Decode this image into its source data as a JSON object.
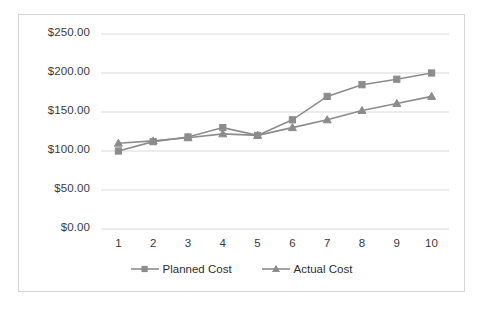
{
  "chart_data": {
    "type": "line",
    "title": "",
    "xlabel": "",
    "ylabel": "",
    "x": [
      1,
      2,
      3,
      4,
      5,
      6,
      7,
      8,
      9,
      10
    ],
    "categories": [
      "1",
      "2",
      "3",
      "4",
      "5",
      "6",
      "7",
      "8",
      "9",
      "10"
    ],
    "series": [
      {
        "name": "Planned Cost",
        "marker": "square",
        "color": "#8c8c8c",
        "values": [
          100,
          112,
          118,
          130,
          120,
          140,
          170,
          185,
          192,
          200
        ]
      },
      {
        "name": "Actual Cost",
        "marker": "triangle",
        "color": "#8c8c8c",
        "values": [
          110,
          113,
          117,
          122,
          120,
          130,
          140,
          152,
          161,
          170
        ]
      }
    ],
    "ylim": [
      0,
      250
    ],
    "ytick_values": [
      0,
      50,
      100,
      150,
      200,
      250
    ],
    "ytick_labels": [
      "$0.00",
      "$50.00",
      "$100.00",
      "$150.00",
      "$200.00",
      "$250.00"
    ],
    "grid": true,
    "grid_axis": "y",
    "grid_color": "#d9d9d9",
    "legend_position": "bottom",
    "border_color": "#d4d4d4",
    "background": "#ffffff"
  },
  "legend": {
    "entries": [
      {
        "label": "Planned Cost"
      },
      {
        "label": "Actual Cost"
      }
    ]
  }
}
